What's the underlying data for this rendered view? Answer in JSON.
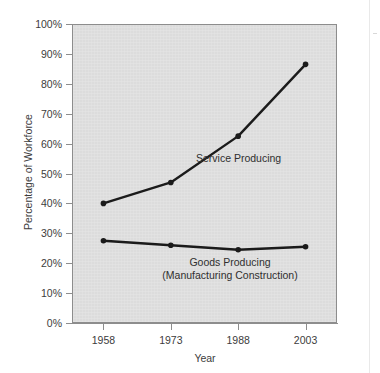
{
  "chart_data": {
    "type": "line",
    "title": "",
    "xlabel": "Year",
    "ylabel": "Percentage of Workforce",
    "categories": [
      "1958",
      "1973",
      "1988",
      "2003"
    ],
    "x": [
      1958,
      1973,
      1988,
      2003
    ],
    "xlim": [
      1951,
      2010
    ],
    "ylim": [
      0,
      100
    ],
    "ytick_labels": [
      "0%",
      "10%",
      "20%",
      "30%",
      "40%",
      "50%",
      "60%",
      "70%",
      "80%",
      "90%",
      "100%"
    ],
    "ytick_values": [
      0,
      10,
      20,
      30,
      40,
      50,
      60,
      70,
      80,
      90,
      100
    ],
    "grid": false,
    "legend_position": "inline-annotations",
    "markers": "filled-circle",
    "series": [
      {
        "name": "Service Producing",
        "label_line1": "Service Producing",
        "label_line2": "",
        "values": [
          40,
          47,
          62.5,
          86.5
        ],
        "color": "#1b1b1b"
      },
      {
        "name": "Goods Producing",
        "label_line1": "Goods Producing",
        "label_line2": "(Manufacturing Construction)",
        "values": [
          27.5,
          26,
          24.5,
          25.5
        ],
        "color": "#1b1b1b"
      }
    ],
    "annotations": [
      {
        "text": "Service Producing",
        "series": "Service Producing"
      },
      {
        "text": "Goods Producing",
        "series": "Goods Producing"
      },
      {
        "text": "(Manufacturing Construction)",
        "series": "Goods Producing"
      }
    ],
    "colors": {
      "plot_background": "#dcdcdc",
      "figure_background": "#ffffff",
      "axis": "#8d8d8d",
      "line": "#1b1b1b",
      "text": "#3c3c3c"
    }
  }
}
